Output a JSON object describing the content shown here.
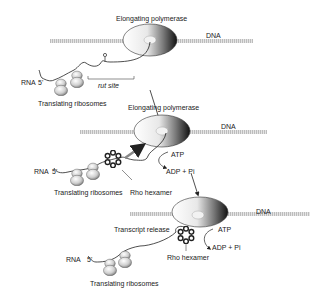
{
  "stages": [
    {
      "polymerase_label": "Elongating polymerase",
      "dna_label": "DNA",
      "rna_label": "RNA",
      "five_prime": "5'",
      "rut_label": "rut site",
      "ribosomes_label": "Translating ribosomes"
    },
    {
      "polymerase_label": "Elongating polymerase",
      "dna_label": "DNA",
      "rna_label": "RNA",
      "five_prime": "5'",
      "ribosomes_label": "Translating ribosomes",
      "rho_label": "Rho hexamer",
      "atp_label": "ATP",
      "adp_label": "ADP + Pi"
    },
    {
      "release_label": "Transcript release",
      "dna_label": "DNA",
      "rna_label": "RNA",
      "five_prime": "5'",
      "ribosomes_label": "Translating ribosomes",
      "rho_label": "Rho hexamer",
      "atp_label": "ATP",
      "adp_label": "ADP + Pi"
    }
  ],
  "colors": {
    "dna": "#c8c8c8",
    "ink": "#222222",
    "rho": "#333333"
  }
}
